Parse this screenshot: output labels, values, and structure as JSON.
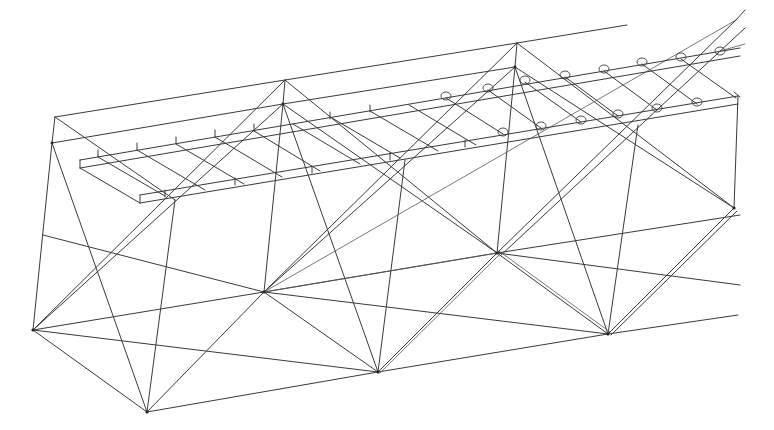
{
  "figure": {
    "stroke_color": "#3a3a3a",
    "background": "#ffffff"
  },
  "nodes": {
    "top_chord": [
      [
        55,
        117
      ],
      [
        285,
        80
      ],
      [
        517,
        43
      ],
      [
        627,
        25
      ]
    ],
    "upper_node": [
      [
        52,
        143
      ],
      [
        283,
        104
      ],
      [
        515,
        67
      ],
      [
        736,
        20
      ]
    ],
    "mid_node": [
      [
        264,
        292
      ],
      [
        497,
        253
      ],
      [
        734,
        208
      ]
    ],
    "lower_node": [
      [
        33,
        330
      ],
      [
        147,
        412
      ],
      [
        378,
        372
      ],
      [
        608,
        334
      ],
      [
        740,
        315
      ]
    ],
    "bolts": [
      [
        446,
        96
      ],
      [
        488,
        88
      ],
      [
        525,
        80
      ],
      [
        565,
        75
      ],
      [
        604,
        69
      ],
      [
        642,
        62
      ],
      [
        681,
        57
      ],
      [
        720,
        51
      ],
      [
        503,
        132
      ],
      [
        541,
        126
      ],
      [
        581,
        120
      ],
      [
        618,
        114
      ],
      [
        657,
        108
      ],
      [
        697,
        102
      ]
    ]
  }
}
